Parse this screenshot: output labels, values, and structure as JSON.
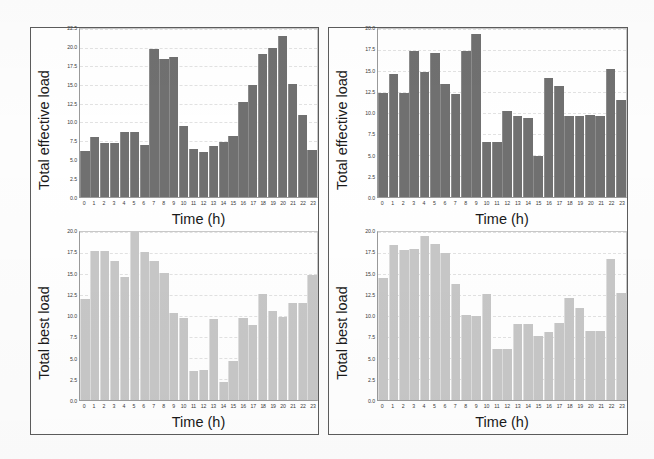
{
  "figure": {
    "panels": [
      {
        "id": "left",
        "charts": [
          {
            "id": "top-left",
            "chart_data": {
              "type": "bar",
              "title": "",
              "xlabel": "Time (h)",
              "ylabel": "Total effective load",
              "categories": [
                "0",
                "1",
                "2",
                "3",
                "4",
                "5",
                "6",
                "7",
                "8",
                "9",
                "10",
                "11",
                "12",
                "13",
                "14",
                "15",
                "16",
                "17",
                "18",
                "19",
                "20",
                "21",
                "22",
                "23"
              ],
              "values": [
                6.2,
                8.0,
                7.2,
                7.3,
                8.7,
                8.7,
                6.9,
                19.8,
                18.5,
                18.7,
                9.5,
                6.4,
                6.0,
                6.8,
                7.4,
                8.2,
                12.7,
                15.0,
                19.2,
                20.0,
                21.6,
                15.2,
                11.0,
                6.3
              ],
              "ylim": [
                0.0,
                22.5
              ],
              "yticks": [
                "0.0",
                "2.5",
                "5.0",
                "7.5",
                "10.0",
                "12.5",
                "15.0",
                "17.5",
                "20.0",
                "22.5"
              ],
              "ytick_values": [
                0.0,
                2.5,
                5.0,
                7.5,
                10.0,
                12.5,
                15.0,
                17.5,
                20.0,
                22.5
              ],
              "grid": true,
              "legend": "none",
              "bar_color": "#707070"
            }
          },
          {
            "id": "bottom-left",
            "chart_data": {
              "type": "bar",
              "title": "",
              "xlabel": "Time (h)",
              "ylabel": "Total best load",
              "categories": [
                "0",
                "1",
                "2",
                "3",
                "4",
                "5",
                "6",
                "7",
                "8",
                "9",
                "10",
                "11",
                "12",
                "13",
                "14",
                "15",
                "16",
                "17",
                "18",
                "19",
                "20",
                "21",
                "22",
                "23"
              ],
              "values": [
                12.0,
                17.7,
                17.7,
                16.6,
                14.7,
                20.3,
                17.6,
                16.6,
                15.1,
                10.3,
                9.8,
                3.5,
                3.6,
                9.7,
                2.1,
                4.6,
                9.8,
                8.9,
                12.6,
                10.6,
                9.9,
                11.6,
                11.5,
                14.9
              ],
              "ylim": [
                0.0,
                20.0
              ],
              "yticks": [
                "0.0",
                "2.5",
                "5.0",
                "7.5",
                "10.0",
                "12.5",
                "15.0",
                "17.5",
                "20.0"
              ],
              "ytick_values": [
                0.0,
                2.5,
                5.0,
                7.5,
                10.0,
                12.5,
                15.0,
                17.5,
                20.0
              ],
              "grid": true,
              "legend": "none",
              "bar_color": "#c7c7c7"
            }
          }
        ]
      },
      {
        "id": "right",
        "charts": [
          {
            "id": "top-right",
            "chart_data": {
              "type": "bar",
              "title": "",
              "xlabel": "Time (h)",
              "ylabel": "Total effective load",
              "categories": [
                "0",
                "1",
                "2",
                "3",
                "4",
                "5",
                "6",
                "7",
                "8",
                "9",
                "10",
                "11",
                "12",
                "13",
                "14",
                "15",
                "16",
                "17",
                "18",
                "19",
                "20",
                "21",
                "22",
                "23"
              ],
              "values": [
                12.4,
                14.6,
                12.4,
                17.4,
                14.9,
                17.1,
                13.4,
                12.3,
                17.4,
                19.4,
                6.5,
                6.5,
                10.2,
                9.6,
                9.4,
                4.9,
                14.2,
                13.2,
                9.7,
                9.7,
                9.8,
                9.6,
                15.2,
                11.6
              ],
              "ylim": [
                0.0,
                20.0
              ],
              "yticks": [
                "0.0",
                "2.5",
                "5.0",
                "7.5",
                "10.0",
                "12.5",
                "15.0",
                "17.5",
                "20.0"
              ],
              "ytick_values": [
                0.0,
                2.5,
                5.0,
                7.5,
                10.0,
                12.5,
                15.0,
                17.5,
                20.0
              ],
              "grid": true,
              "legend": "none",
              "bar_color": "#707070"
            }
          },
          {
            "id": "bottom-right",
            "chart_data": {
              "type": "bar",
              "title": "",
              "xlabel": "Time (h)",
              "ylabel": "Total best load",
              "categories": [
                "0",
                "1",
                "2",
                "3",
                "4",
                "5",
                "6",
                "7",
                "8",
                "9",
                "10",
                "11",
                "12",
                "13",
                "14",
                "15",
                "16",
                "17",
                "18",
                "19",
                "20",
                "21",
                "22",
                "23"
              ],
              "values": [
                14.5,
                18.4,
                17.9,
                18.0,
                19.5,
                18.6,
                17.5,
                13.8,
                10.1,
                10.0,
                12.6,
                6.1,
                6.1,
                9.1,
                9.1,
                7.6,
                8.1,
                9.2,
                12.1,
                11.0,
                8.2,
                8.2,
                16.8,
                12.7
              ],
              "ylim": [
                0.0,
                20.0
              ],
              "yticks": [
                "0.0",
                "2.5",
                "5.0",
                "7.5",
                "10.0",
                "12.5",
                "15.0",
                "17.5",
                "20.0"
              ],
              "ytick_values": [
                0.0,
                2.5,
                5.0,
                7.5,
                10.0,
                12.5,
                15.0,
                17.5,
                20.0
              ],
              "grid": true,
              "legend": "none",
              "bar_color": "#c7c7c7"
            }
          }
        ]
      }
    ]
  }
}
